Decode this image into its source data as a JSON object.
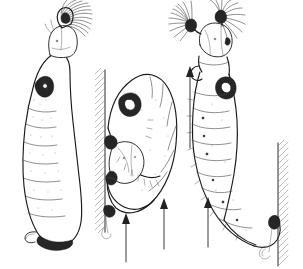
{
  "figure": {
    "title": "Blackfly larvae attachment and feeding postures",
    "background_color": "#ffffff",
    "ink_color": "#1a1a1a",
    "width": 303,
    "height": 269,
    "panel_count": 3,
    "caption": ""
  },
  "panels": [
    {
      "id": "left",
      "name": "larva-upright-filtering",
      "label": "",
      "description": "Blackfly larva standing erect, attached by posterior abdominal circlet, head capsule uppermost with a single labral fan spread open",
      "orientation": "vertical, head up",
      "fan_count": 1,
      "has_substrate": false,
      "flow_arrows": 0
    },
    {
      "id": "middle",
      "name": "larva-curled-on-substrate",
      "label": "",
      "description": "Larva bent into a hook shape against a vertical hatched substrate, head folded back toward the attachment point",
      "orientation": "curved, head down against wall",
      "fan_count": 0,
      "has_substrate": true,
      "substrate_side": "left",
      "flow_arrows": 2
    },
    {
      "id": "right",
      "name": "larva-twisted-filtering",
      "label": "",
      "description": "Larva with body twisted, head uppermost showing a pair of spread labral fans, posterior attached to a vertical hatched substrate at right",
      "orientation": "vertical, head up, body twisted",
      "fan_count": 2,
      "has_substrate": true,
      "substrate_side": "right",
      "flow_arrows": 2
    }
  ],
  "anatomy": {
    "labral_fan": "cephalic filtering fan",
    "head_capsule": "head-capsule",
    "proleg": "thoracic proleg",
    "abdomen": "abdomen",
    "posterior_circlet": "posterior attachment circlet",
    "anal_papillae": "anal papillae"
  },
  "annotations": {
    "flow_direction": "upward",
    "arrow_color": "#222222",
    "substrate_hatch_color": "#777777"
  }
}
